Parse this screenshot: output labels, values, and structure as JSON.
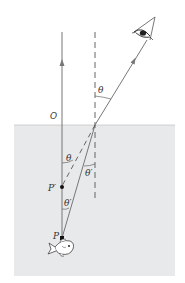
{
  "diagram": {
    "colors": {
      "water": "#e8e9ea",
      "ray": "#777777",
      "normal": "#555555",
      "point": "#111111"
    },
    "labels": {
      "origin": "O",
      "theta_air": "θ",
      "theta_water_left": "θ",
      "theta_prime_right": "θ′",
      "image_point": "P′",
      "theta_prime_lower": "θ′",
      "object_point": "P"
    },
    "icons": {
      "observer": "eye-icon",
      "object": "fish-icon"
    }
  }
}
